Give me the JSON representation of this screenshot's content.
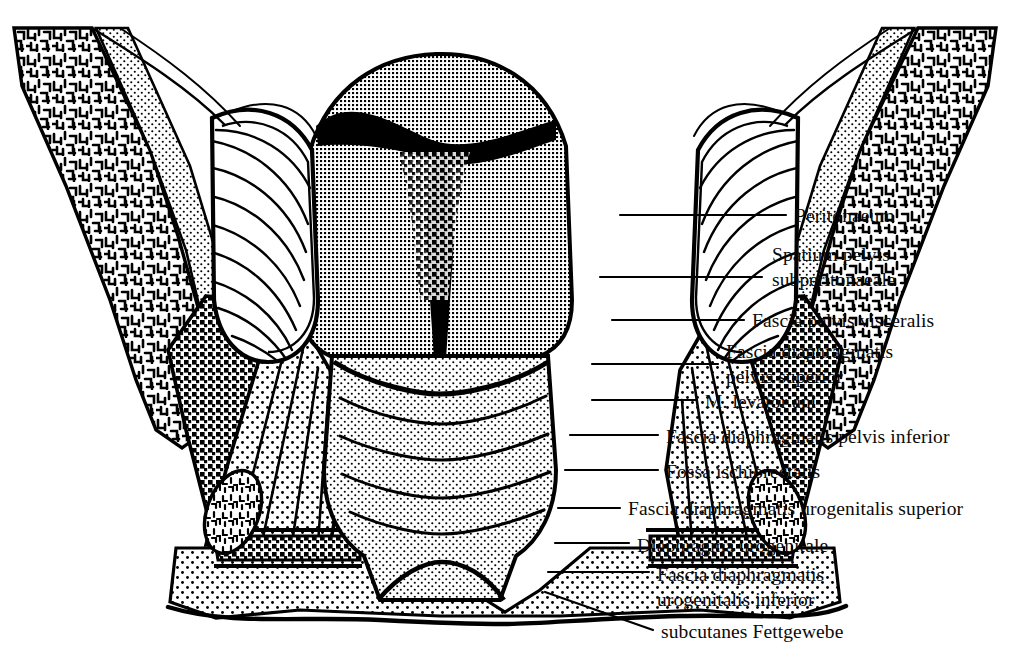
{
  "figure": {
    "type": "anatomical-line-diagram",
    "language": "la-de",
    "colors": {
      "ink": "#000000",
      "paper": "#ffffff",
      "label_text": "#0a0a0a"
    },
    "dimensions": {
      "width": 1010,
      "height": 671
    }
  },
  "labels": [
    {
      "id": "peritonaeum",
      "text": "Peritonaeum",
      "lines": [
        "Peritonaeum"
      ],
      "x": 795,
      "y": 215,
      "leader_from": [
        620,
        215
      ],
      "leader_to": [
        786,
        215
      ]
    },
    {
      "id": "spatium-pelvis",
      "text": "Spatium pelvis subperitonaeale",
      "lines": [
        "Spatium pelvis",
        "subperitonaeale"
      ],
      "x": 772,
      "y": 261,
      "leader_from": [
        600,
        277
      ],
      "leader_to": [
        762,
        277
      ]
    },
    {
      "id": "fascia-visceralis",
      "text": "Fascia pelvis visceralis",
      "lines": [
        "Fascia pelvis visceralis"
      ],
      "x": 752,
      "y": 320,
      "leader_from": [
        612,
        320
      ],
      "leader_to": [
        744,
        320
      ]
    },
    {
      "id": "fascia-sup",
      "text": "Fascia diaphragmatis pelvis superior",
      "lines": [
        "Fascia diaphragmatis",
        "pelvis superior"
      ],
      "x": 726,
      "y": 358,
      "leader_from": [
        592,
        364
      ],
      "leader_to": [
        718,
        364
      ]
    },
    {
      "id": "levator-ani",
      "text": "M. levator ani",
      "lines": [
        "M. levator ani"
      ],
      "x": 705,
      "y": 404,
      "leader_from": [
        592,
        400
      ],
      "leader_to": [
        697,
        400
      ]
    },
    {
      "id": "fascia-inf",
      "text": "Fascia diaphragmatis pelvis inferior",
      "lines": [
        "Fascia diaphragmatis pelvis inferior"
      ],
      "x": 666,
      "y": 438,
      "leader_from": [
        570,
        435
      ],
      "leader_to": [
        658,
        435
      ]
    },
    {
      "id": "fossa-ischio",
      "text": "Fossa ischiorectalis",
      "lines": [
        "Fossa ischiorectalis"
      ],
      "x": 666,
      "y": 473,
      "leader_from": [
        565,
        470
      ],
      "leader_to": [
        658,
        470
      ]
    },
    {
      "id": "fascia-uro-sup",
      "text": "Fascia diaphragmatis urogenitalis superior",
      "lines": [
        "Fascia diaphragmatis urogenitalis superior"
      ],
      "x": 628,
      "y": 509,
      "leader_from": [
        558,
        508
      ],
      "leader_to": [
        620,
        508
      ]
    },
    {
      "id": "diaphragma-uro",
      "text": "Diaphragma urogenitale",
      "lines": [
        "Diaphragma urogenitale"
      ],
      "x": 637,
      "y": 547,
      "leader_from": [
        555,
        543
      ],
      "leader_to": [
        629,
        543
      ]
    },
    {
      "id": "fascia-uro-inf",
      "text": "Fascia diaphragmatis urogenitalis inferior",
      "lines": [
        "Fascia diaphragmatis",
        "urogenitalis inferior"
      ],
      "x": 657,
      "y": 578,
      "leader_from": [
        548,
        572
      ],
      "leader_to": [
        649,
        572
      ]
    },
    {
      "id": "subkutan",
      "text": "subcutanes Fettgewebe",
      "lines": [
        "subcutanes Fettgewebe"
      ],
      "x": 661,
      "y": 634,
      "leader_from": [
        545,
        592
      ],
      "leader_to": [
        653,
        630
      ]
    }
  ],
  "structures": [
    {
      "id": "os-coxae-left",
      "name": "left hip bone",
      "texture": "trabecular"
    },
    {
      "id": "os-coxae-right",
      "name": "right hip bone",
      "texture": "trabecular"
    },
    {
      "id": "uterus",
      "name": "uterus corpus",
      "texture": "fine-grid"
    },
    {
      "id": "cavitas-uteri",
      "name": "uterine cavity",
      "texture": "solid-black"
    },
    {
      "id": "lig-latum-left",
      "name": "left broad ligament",
      "texture": "flow-lines"
    },
    {
      "id": "lig-latum-right",
      "name": "right broad ligament",
      "texture": "flow-lines"
    },
    {
      "id": "vagina",
      "name": "vagina with rugae",
      "texture": "stipple"
    },
    {
      "id": "levator-left",
      "name": "left levator ani muscle",
      "texture": "stipple"
    },
    {
      "id": "levator-right",
      "name": "right levator ani muscle",
      "texture": "stipple"
    },
    {
      "id": "fossa-left",
      "name": "left ischiorectal fossa",
      "texture": "coarse-mesh"
    },
    {
      "id": "fossa-right",
      "name": "right ischiorectal fossa",
      "texture": "coarse-mesh"
    },
    {
      "id": "tuber-left",
      "name": "left ischial tuberosity",
      "texture": "trabecular"
    },
    {
      "id": "tuber-right",
      "name": "right ischial tuberosity",
      "texture": "trabecular"
    },
    {
      "id": "subcutis",
      "name": "subcutaneous fat",
      "texture": "stipple"
    }
  ]
}
